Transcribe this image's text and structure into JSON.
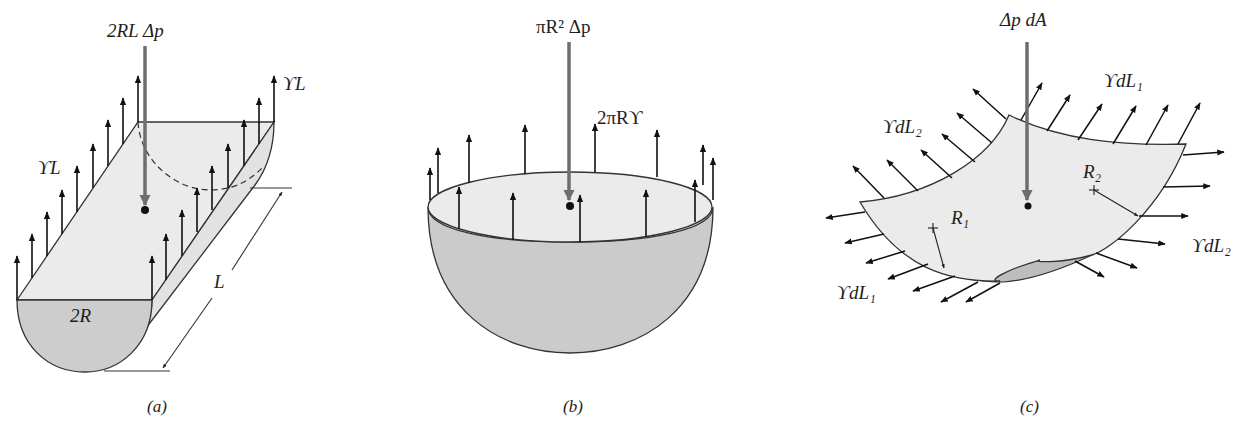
{
  "figure": {
    "colors": {
      "surface_light": "#eaeaea",
      "surface_dark": "#c9c9c9",
      "pressure_arrow": "#6e6e6e",
      "tension_arrow": "#111111",
      "outline": "#333333"
    },
    "panels": [
      {
        "id": "a",
        "caption": "(a)",
        "title": "Half-cylinder",
        "labels": {
          "pressure_force": "2RL Δp",
          "tension_left": "ϒL",
          "tension_right": "ϒL",
          "diameter": "2R",
          "length": "L"
        }
      },
      {
        "id": "b",
        "caption": "(b)",
        "title": "Hemisphere",
        "labels": {
          "pressure_force": "πR² Δp",
          "tension": "2πRϒ"
        }
      },
      {
        "id": "c",
        "caption": "(c)",
        "title": "Curved surface element",
        "labels": {
          "pressure_force": "Δp dA",
          "tension_top": "ϒdL₁",
          "tension_left": "ϒdL₂",
          "tension_right": "ϒdL₂",
          "tension_bottom": "ϒdL₁",
          "radius_1": "R₁",
          "radius_2": "R₂"
        }
      }
    ]
  }
}
